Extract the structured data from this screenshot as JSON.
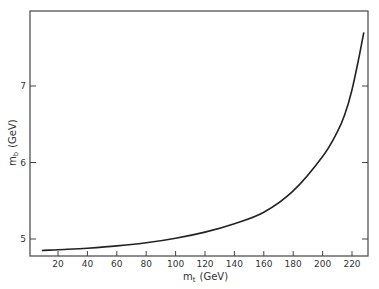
{
  "chart_data": {
    "type": "line",
    "title": "",
    "xlabel": "m_t (GeV)",
    "ylabel": "m_b (GeV)",
    "xlim": [
      0,
      230
    ],
    "ylim": [
      4.8,
      7.95
    ],
    "x_ticks": [
      20,
      40,
      60,
      80,
      100,
      120,
      140,
      160,
      180,
      200,
      220
    ],
    "y_ticks": [
      5,
      6,
      7
    ],
    "grid": false,
    "legend": null,
    "series": [
      {
        "name": "m_b vs m_t",
        "x": [
          9,
          20,
          40,
          60,
          80,
          100,
          120,
          140,
          160,
          180,
          200,
          210,
          215,
          220,
          225,
          228
        ],
        "values": [
          4.85,
          4.86,
          4.88,
          4.91,
          4.95,
          5.01,
          5.09,
          5.2,
          5.35,
          5.63,
          6.08,
          6.4,
          6.62,
          6.95,
          7.4,
          7.7
        ]
      }
    ]
  },
  "axes": {
    "x_label_main": "m",
    "x_label_sub": "t",
    "x_label_unit": "(GeV)",
    "y_label_main": "m",
    "y_label_sub": "b",
    "y_label_unit": "(GeV)"
  }
}
